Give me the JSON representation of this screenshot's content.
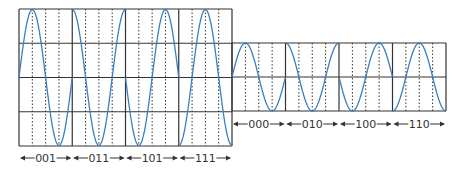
{
  "diagram": {
    "type": "8-QAM waveform (phase + amplitude)",
    "colors": {
      "grid": "#333333",
      "dotted": "#333333",
      "wave": "#3a7fbf",
      "text": "#333333",
      "arrow": "#333333"
    },
    "high_amplitude_block": {
      "x0": 19,
      "x1": 232,
      "y_top": 9,
      "y_bottom": 146,
      "center": 77.5,
      "amplitude": 68,
      "symbols": [
        {
          "label": "001",
          "phase": "sin"
        },
        {
          "label": "011",
          "phase": "cos"
        },
        {
          "label": "101",
          "phase": "-sin"
        },
        {
          "label": "111",
          "phase": "-cos"
        }
      ]
    },
    "low_amplitude_block": {
      "x0": 232,
      "x1": 446,
      "y_top": 43,
      "y_bottom": 111,
      "center": 77,
      "amplitude": 34,
      "symbols": [
        {
          "label": "000",
          "phase": "sin"
        },
        {
          "label": "010",
          "phase": "cos"
        },
        {
          "label": "100",
          "phase": "-sin"
        },
        {
          "label": "110",
          "phase": "-cos"
        }
      ]
    },
    "labels_high_y": 158,
    "labels_low_y": 124
  }
}
